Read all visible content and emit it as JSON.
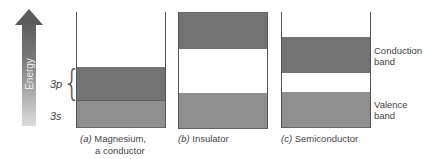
{
  "arrow": {
    "label": "Energy",
    "gradient": [
      "#5e5e5e",
      "#dcdcdc"
    ]
  },
  "colors": {
    "conduction_band": "#737373",
    "valence_band": "#8f8f8f",
    "gap": "#ffffff"
  },
  "panels": [
    {
      "id": "a",
      "caption_letter": "(a)",
      "caption_line1": "Magnesium,",
      "caption_line2": "a conductor",
      "bands": [
        {
          "name": "3p",
          "label": "3p"
        },
        {
          "name": "3s",
          "label": "3s"
        }
      ]
    },
    {
      "id": "b",
      "caption_letter": "(b)",
      "caption_text": "Insulator"
    },
    {
      "id": "c",
      "caption_letter": "(c)",
      "caption_text": "Semiconductor",
      "side_labels": {
        "conduction_line1": "Conduction",
        "conduction_line2": "band",
        "valence_line1": "Valence",
        "valence_line2": "band"
      }
    }
  ]
}
